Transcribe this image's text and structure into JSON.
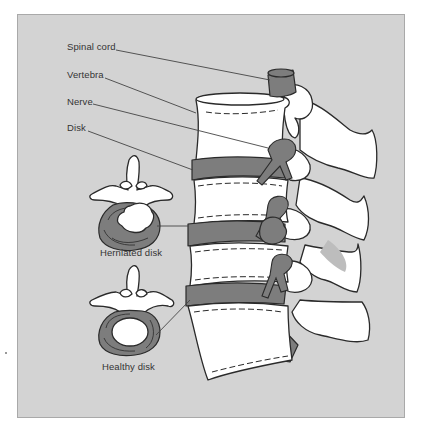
{
  "diagram": {
    "labels": {
      "spinal_cord": "Spinal cord",
      "vertebra": "Vertebra",
      "nerve": "Nerve",
      "disk": "Disk",
      "herniated_disk": "Herniated disk",
      "healthy_disk": "Healthy disk"
    },
    "colors": {
      "background": "#d3d3d3",
      "bone": "#ffffff",
      "disk": "#7d7d7d",
      "outline": "#2a2a2a",
      "leader_line": "#444444",
      "frame_border": "#a9a9a9"
    }
  }
}
